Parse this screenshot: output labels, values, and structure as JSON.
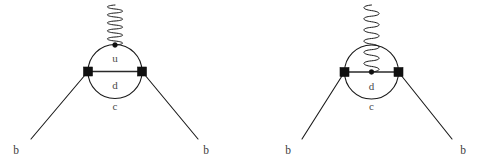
{
  "figure": {
    "width": 490,
    "height": 163,
    "background": "#ffffff",
    "line_color": "#1a1a1a",
    "vertex_color": "#101010",
    "label_color": "#4a4a4a"
  },
  "diagrams": [
    {
      "id": "left-diagram",
      "name": "penguin-diagram-gluon-external",
      "geometry": {
        "circle_cx": 115,
        "circle_cy": 71.5,
        "circle_r": 27,
        "vertex_left_x": 88,
        "vertex_left_y": 71.5,
        "vertex_right_x": 142,
        "vertex_right_y": 71.5,
        "square_size": 9,
        "gluon_attach_x": 115,
        "gluon_attach_y": 45,
        "gluon_top_y": 5,
        "gluon_coils": 5,
        "gluon_amplitude": 7,
        "leg_left_end_x": 31,
        "leg_left_end_y": 139,
        "leg_right_end_x": 198,
        "leg_right_end_y": 139
      },
      "labels": {
        "loop_upper": "u",
        "loop_lower": "d",
        "loop_outer": "c",
        "in_leg": "b",
        "out_leg": "b"
      },
      "label_positions": {
        "loop_upper_x": 115,
        "loop_upper_y": 62,
        "loop_lower_x": 115,
        "loop_lower_y": 89,
        "loop_outer_x": 115,
        "loop_outer_y": 110,
        "in_leg_x": 16,
        "in_leg_y": 154,
        "out_leg_x": 206,
        "out_leg_y": 154
      }
    },
    {
      "id": "right-diagram",
      "name": "penguin-diagram-gluon-internal",
      "geometry": {
        "circle_cx": 371.5,
        "circle_cy": 72,
        "circle_r": 27,
        "vertex_left_x": 344.5,
        "vertex_left_y": 72,
        "vertex_right_x": 398.5,
        "vertex_right_y": 72,
        "square_size": 9,
        "gluon_attach_x": 371.5,
        "gluon_attach_y": 72,
        "gluon_top_y": 5,
        "gluon_coils": 6,
        "gluon_amplitude": 7,
        "leg_left_end_x": 302,
        "leg_left_end_y": 139,
        "leg_right_end_x": 452,
        "leg_right_end_y": 139
      },
      "labels": {
        "loop_lower": "d",
        "loop_outer": "c",
        "in_leg": "b",
        "out_leg": "b"
      },
      "label_positions": {
        "loop_lower_x": 371.5,
        "loop_lower_y": 90,
        "loop_outer_x": 371.5,
        "loop_outer_y": 110,
        "in_leg_x": 288,
        "in_leg_y": 154,
        "out_leg_x": 463,
        "out_leg_y": 154
      }
    }
  ]
}
